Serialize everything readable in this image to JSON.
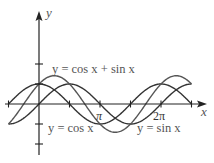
{
  "chart_data": {
    "type": "line",
    "title": "",
    "xlabel": "x",
    "ylabel": "y",
    "x_tick_labels": [
      {
        "label": "π",
        "value": 3.14159
      },
      {
        "label": "2π",
        "value": 6.28318
      }
    ],
    "x_ticks": [
      -1.5708,
      1.5708,
      3.14159,
      4.7124,
      6.28318,
      7.854
    ],
    "y_ticks": [
      -2,
      -1,
      1,
      2
    ],
    "xlim": [
      -1.6,
      8.3
    ],
    "ylim": [
      -2.5,
      4.6
    ],
    "grid": false,
    "legend": "inline annotations",
    "series": [
      {
        "name": "y = cos x",
        "function": "cos(x)",
        "x_range": [
          -1.5708,
          7.854
        ],
        "color": "#333333"
      },
      {
        "name": "y = sin x",
        "function": "sin(x)",
        "x_range": [
          -1.5708,
          7.854
        ],
        "color": "#333333"
      },
      {
        "name": "y = cos x + sin x",
        "function": "cos(x)+sin(x)",
        "x_range": [
          -1.5708,
          7.854
        ],
        "color": "#555555"
      }
    ],
    "annotations": [
      {
        "text": "y = cos x + sin x",
        "position": "above, near x≈0.3–2.6"
      },
      {
        "text": "y = cos x",
        "position": "below axis, near x≈0.5–2.6"
      },
      {
        "text": "y = sin x",
        "position": "below axis, near x≈4.6–6.8"
      }
    ]
  },
  "labels": {
    "y_axis": "y",
    "x_axis": "x",
    "pi": "π",
    "two_pi": "2π",
    "sum_curve": "y = cos x + sin x",
    "cos_curve": "y = cos x",
    "sin_curve": "y = sin x"
  },
  "style": {
    "axis_color": "#222222",
    "curve_color": "#333333",
    "label_color": "#555555"
  }
}
